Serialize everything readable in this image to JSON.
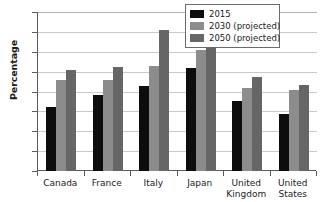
{
  "chart_data": {
    "type": "bar",
    "title": "",
    "xlabel": "",
    "ylabel": "Percentage",
    "ylim": [
      0,
      40
    ],
    "ytick_values": [
      0,
      5,
      10,
      15,
      20,
      25,
      30,
      35,
      40
    ],
    "ytick_labels": [
      "0",
      "5",
      "10",
      "15",
      "20",
      "25",
      "30",
      "35",
      "40"
    ],
    "grid": "horizontal",
    "legend_position": "top-right",
    "categories": [
      "Canada",
      "France",
      "Italy",
      "Japan",
      "United Kingdom",
      "United States"
    ],
    "category_label_lines": [
      [
        "Canada"
      ],
      [
        "France"
      ],
      [
        "Italy"
      ],
      [
        "Japan"
      ],
      [
        "United",
        "Kingdom"
      ],
      [
        "United",
        "States"
      ]
    ],
    "series": [
      {
        "name": "2015",
        "color": "#0d0d0d",
        "values": [
          16.1,
          19.0,
          21.3,
          26.0,
          17.7,
          14.3
        ]
      },
      {
        "name": "2030 (projected)",
        "color": "#8c8c8c",
        "values": [
          23.0,
          23.0,
          26.4,
          30.5,
          21.0,
          20.4
        ]
      },
      {
        "name": "2050 (projected)",
        "color": "#666666",
        "values": [
          25.5,
          26.1,
          35.6,
          36.4,
          23.6,
          21.7
        ]
      }
    ]
  },
  "colors": {
    "axis": "#5a5a5a",
    "gridline": "#c9c9c9",
    "background": "#ffffff",
    "legend_border": "#6a6a6a",
    "series_2015": "#0d0d0d",
    "series_2030": "#8c8c8c",
    "series_2050": "#666666"
  }
}
